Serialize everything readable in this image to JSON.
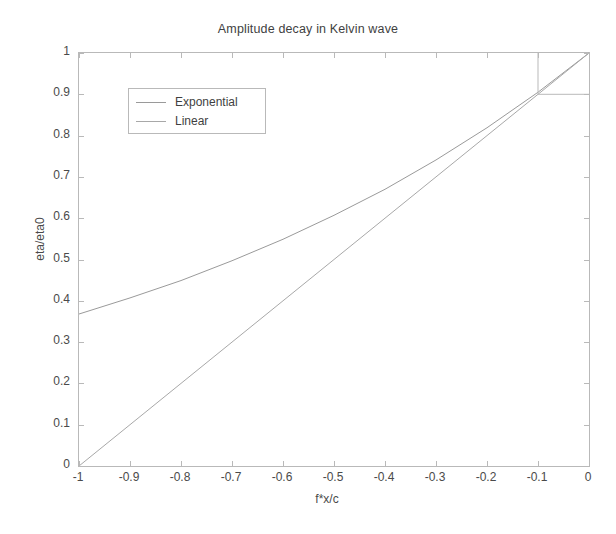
{
  "chart_data": {
    "type": "line",
    "title": "Amplitude decay in Kelvin wave",
    "xlabel": "f*x/c",
    "ylabel": "eta/eta0",
    "xlim": [
      -1,
      0
    ],
    "ylim": [
      0,
      1
    ],
    "grid": false,
    "legend_position": "upper left",
    "xticks": [
      "-1",
      "-0.9",
      "-0.8",
      "-0.7",
      "-0.6",
      "-0.5",
      "-0.4",
      "-0.3",
      "-0.2",
      "-0.1",
      "0"
    ],
    "xtick_values": [
      -1,
      -0.9,
      -0.8,
      -0.7,
      -0.6,
      -0.5,
      -0.4,
      -0.3,
      -0.2,
      -0.1,
      0
    ],
    "yticks": [
      "0",
      "0.1",
      "0.2",
      "0.3",
      "0.4",
      "0.5",
      "0.6",
      "0.7",
      "0.8",
      "0.9",
      "1"
    ],
    "ytick_values": [
      0,
      0.1,
      0.2,
      0.3,
      0.4,
      0.5,
      0.6,
      0.7,
      0.8,
      0.9,
      1
    ],
    "x": [
      -1,
      -0.9,
      -0.8,
      -0.7,
      -0.6,
      -0.5,
      -0.4,
      -0.3,
      -0.2,
      -0.1,
      0
    ],
    "series": [
      {
        "name": "Exponential",
        "color": "#9a9a9a",
        "style": "solid",
        "values": [
          0.368,
          0.407,
          0.449,
          0.497,
          0.549,
          0.607,
          0.67,
          0.741,
          0.819,
          0.905,
          1.0
        ]
      },
      {
        "name": "Linear",
        "color": "#a8a8a8",
        "style": "solid",
        "values": [
          0.0,
          0.1,
          0.2,
          0.3,
          0.4,
          0.5,
          0.6,
          0.7,
          0.8,
          0.9,
          1.0
        ]
      }
    ],
    "annotations": [
      {
        "name": "guide-vertical",
        "type": "vline",
        "x": -0.1,
        "y_from": 0.9,
        "y_to": 1.0,
        "color": "#b9b9b9"
      },
      {
        "name": "guide-horizontal",
        "type": "hline",
        "y": 0.9,
        "x_from": -0.1,
        "x_to": 0,
        "color": "#b9b9b9"
      }
    ]
  },
  "legend": {
    "entries": [
      {
        "label": "Exponential"
      },
      {
        "label": "Linear"
      }
    ]
  }
}
